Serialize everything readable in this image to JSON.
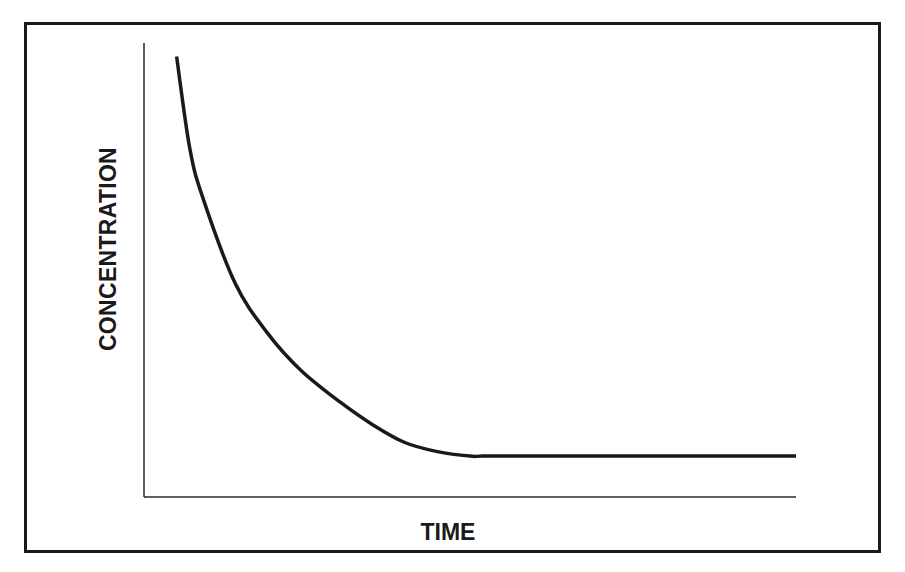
{
  "chart_data": {
    "type": "line",
    "title": "",
    "xlabel": "TIME",
    "ylabel": "CONCENTRATION",
    "grid": false,
    "legend": null,
    "x_ticks": [],
    "y_ticks": [],
    "series": [
      {
        "name": "concentration",
        "x": [
          0.05,
          0.07,
          0.09,
          0.14,
          0.19,
          0.24,
          0.3,
          0.35,
          0.4,
          0.45,
          0.5,
          0.52,
          0.6,
          0.7,
          0.8,
          0.9,
          1.0
        ],
        "values": [
          0.97,
          0.77,
          0.66,
          0.47,
          0.36,
          0.28,
          0.21,
          0.16,
          0.12,
          0.1,
          0.09,
          0.09,
          0.09,
          0.09,
          0.09,
          0.09,
          0.09
        ]
      }
    ],
    "xlim": [
      0,
      1
    ],
    "ylim": [
      0,
      1
    ]
  },
  "colors": {
    "line": "#1a1a1a",
    "axis": "#2a2a2a",
    "border": "#1a1a1a",
    "background": "#ffffff"
  }
}
